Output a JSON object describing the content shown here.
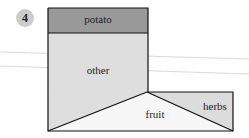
{
  "badge": {
    "number": "4"
  },
  "labels": {
    "potato": "potato",
    "other": "other",
    "fruit": "fruit",
    "herbs": "herbs"
  },
  "colors": {
    "potato": "#999999",
    "other": "#dedede",
    "fruit": "#f7f7f7",
    "herbs": "#dcdcdc",
    "badge": "#cccccc",
    "stroke": "#111111"
  }
}
